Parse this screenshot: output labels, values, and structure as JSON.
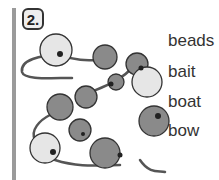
{
  "exercise": {
    "number_label": "2.",
    "words": [
      "beads",
      "bait",
      "boat",
      "bow"
    ]
  },
  "illustration": {
    "subject": "beads on a string",
    "colors": {
      "light_bead": "#e6e6e6",
      "dark_bead": "#8a8a8a",
      "string": "#777777",
      "outline": "#333333"
    }
  }
}
